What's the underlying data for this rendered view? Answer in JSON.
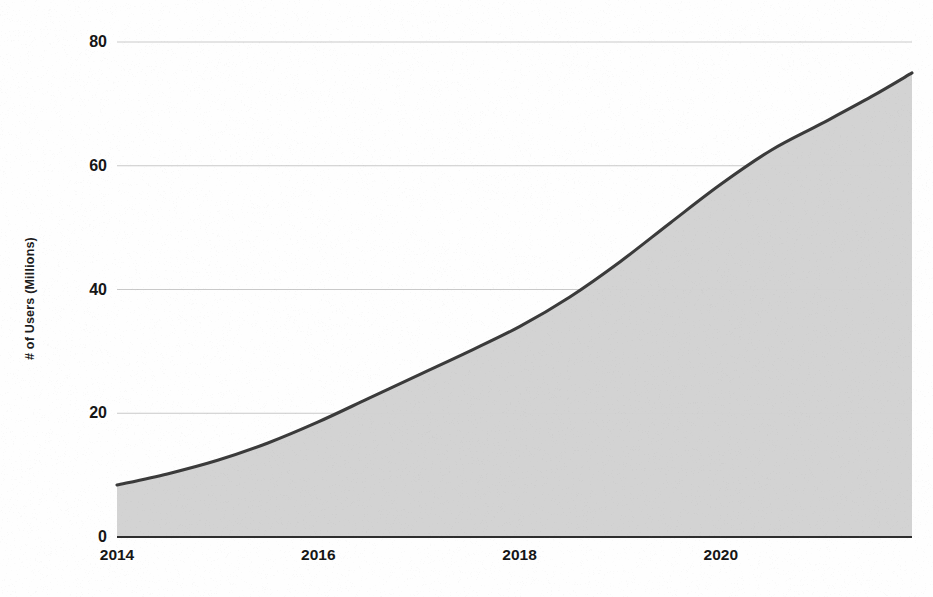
{
  "chart_data": {
    "type": "area",
    "title": "",
    "xlabel": "",
    "ylabel": "# of Users (Millions)",
    "x": [
      2014,
      2014.5,
      2015,
      2015.5,
      2016,
      2016.5,
      2017,
      2017.5,
      2018,
      2018.5,
      2019,
      2019.5,
      2020,
      2020.5,
      2021,
      2021.5,
      2021.9
    ],
    "values": [
      8.4,
      10.2,
      12.4,
      15.2,
      18.6,
      22.4,
      26.2,
      30.0,
      34.0,
      38.8,
      44.5,
      50.8,
      57.0,
      62.5,
      66.8,
      71.2,
      75.0
    ],
    "series": [
      {
        "name": "# of Users (Millions)",
        "values": [
          8.4,
          10.2,
          12.4,
          15.2,
          18.6,
          22.4,
          26.2,
          30.0,
          34.0,
          38.8,
          44.5,
          50.8,
          57.0,
          62.5,
          66.8,
          71.2,
          75.0
        ]
      }
    ],
    "xlim": [
      2014,
      2021.9
    ],
    "ylim": [
      0,
      80
    ],
    "y_ticks": [
      0,
      20,
      40,
      60,
      80
    ],
    "y_tick_labels": [
      "0",
      "20",
      "40",
      "60",
      "80"
    ],
    "x_ticks": [
      2014,
      2016,
      2018,
      2020
    ],
    "x_tick_labels": [
      "2014",
      "2016",
      "2018",
      "2020"
    ],
    "grid": true,
    "grid_axis": "y",
    "legend": false,
    "legend_position": "none",
    "colors": {
      "fill": "#d2d2d2",
      "line": "#3b3b3b",
      "gridline": "#c9c9c9",
      "axis": "#2e2e2e",
      "text": "#161616",
      "background": "#fefefe"
    }
  }
}
